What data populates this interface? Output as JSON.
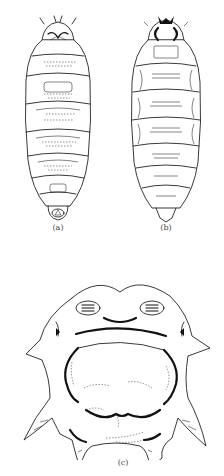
{
  "figure": {
    "panels": [
      {
        "id": "a",
        "label": "(a)",
        "description": "larva dorsal view"
      },
      {
        "id": "b",
        "label": "(b)",
        "description": "larva ventral view"
      },
      {
        "id": "c",
        "label": "(c)",
        "description": "posterior end detail"
      }
    ],
    "colors": {
      "line": "#222222",
      "background": "#ffffff",
      "label": "#444444"
    }
  }
}
